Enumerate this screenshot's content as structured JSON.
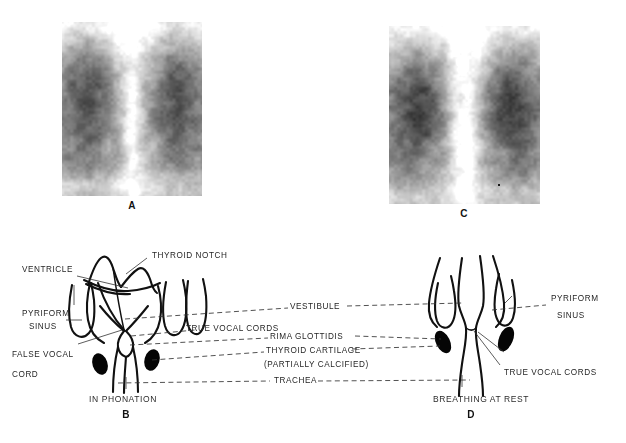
{
  "figure": {
    "panels": [
      {
        "id": "A",
        "kind": "radiograph",
        "letter": "A",
        "pair": "B"
      },
      {
        "id": "B",
        "kind": "line-diagram",
        "letter": "B",
        "caption": "IN PHONATION"
      },
      {
        "id": "C",
        "kind": "radiograph",
        "letter": "C",
        "pair": "D"
      },
      {
        "id": "D",
        "kind": "line-diagram",
        "letter": "D",
        "caption": "BREATHING AT REST"
      }
    ]
  },
  "labels": {
    "left": [
      {
        "key": "ventricle",
        "text": "VENTRICLE"
      },
      {
        "key": "pyriform_1",
        "text": "PYRIFORM"
      },
      {
        "key": "pyriform_2",
        "text": "SINUS"
      },
      {
        "key": "false_cord_1",
        "text": "FALSE VOCAL"
      },
      {
        "key": "false_cord_2",
        "text": "CORD"
      }
    ],
    "upper": [
      {
        "key": "thyroid_notch",
        "text": "THYROID NOTCH"
      },
      {
        "key": "true_cords_b",
        "text": "TRUE VOCAL CORDS"
      }
    ],
    "center": [
      {
        "key": "vestibule",
        "text": "VESTIBULE"
      },
      {
        "key": "rima",
        "text": "RIMA GLOTTIDIS"
      },
      {
        "key": "thyroid_c",
        "text": "THYROID CARTILAGE"
      },
      {
        "key": "calcified",
        "text": "(PARTIALLY CALCIFIED)"
      },
      {
        "key": "trachea",
        "text": "TRACHEA"
      }
    ],
    "right": [
      {
        "key": "pyriform_r1",
        "text": "PYRIFORM"
      },
      {
        "key": "pyriform_r2",
        "text": "SINUS"
      },
      {
        "key": "true_cords_d",
        "text": "TRUE VOCAL CORDS"
      }
    ]
  },
  "captions": {
    "b": "IN PHONATION",
    "d": "BREATHING AT REST"
  },
  "letters": {
    "a": "A",
    "b": "B",
    "c": "C",
    "d": "D"
  },
  "colors": {
    "ink": "#111111",
    "leader": "#333333",
    "text": "#262626",
    "page": "#ffffff"
  }
}
